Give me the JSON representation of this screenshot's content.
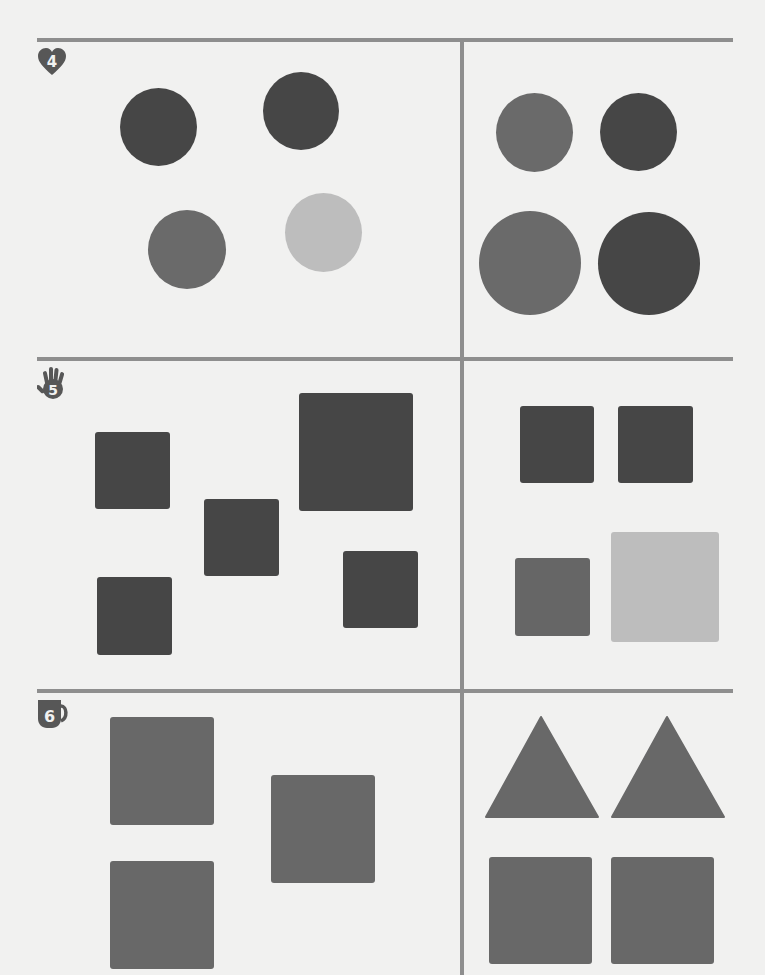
{
  "worksheet": {
    "colors": {
      "dark": "#464646",
      "mid": "#6a6a6a",
      "light": "#bdbdbd",
      "rule": "#8e8e8e",
      "paper": "#f1f1f0"
    },
    "sections": [
      {
        "number": "4",
        "icon": "heart-icon",
        "left": [
          {
            "shape": "circle",
            "tone": "dark"
          },
          {
            "shape": "circle",
            "tone": "dark"
          },
          {
            "shape": "circle",
            "tone": "mid"
          },
          {
            "shape": "circle",
            "tone": "light"
          }
        ],
        "right": [
          {
            "shape": "circle",
            "tone": "mid"
          },
          {
            "shape": "circle",
            "tone": "dark"
          },
          {
            "shape": "circle",
            "tone": "mid",
            "size": "large"
          },
          {
            "shape": "circle",
            "tone": "dark",
            "size": "large"
          }
        ]
      },
      {
        "number": "5",
        "icon": "hand-icon",
        "left": [
          {
            "shape": "square",
            "tone": "dark"
          },
          {
            "shape": "square",
            "tone": "dark"
          },
          {
            "shape": "square",
            "tone": "dark",
            "size": "large"
          },
          {
            "shape": "square",
            "tone": "dark"
          },
          {
            "shape": "square",
            "tone": "dark"
          }
        ],
        "right": [
          {
            "shape": "square",
            "tone": "dark"
          },
          {
            "shape": "square",
            "tone": "dark"
          },
          {
            "shape": "square",
            "tone": "mid"
          },
          {
            "shape": "square",
            "tone": "light",
            "size": "large"
          }
        ]
      },
      {
        "number": "6",
        "icon": "mug-icon",
        "left": [
          {
            "shape": "square",
            "tone": "mid"
          },
          {
            "shape": "square",
            "tone": "mid"
          },
          {
            "shape": "square",
            "tone": "mid"
          }
        ],
        "right": [
          {
            "shape": "triangle",
            "tone": "mid"
          },
          {
            "shape": "triangle",
            "tone": "mid"
          },
          {
            "shape": "square",
            "tone": "mid"
          },
          {
            "shape": "square",
            "tone": "mid"
          }
        ]
      }
    ]
  }
}
